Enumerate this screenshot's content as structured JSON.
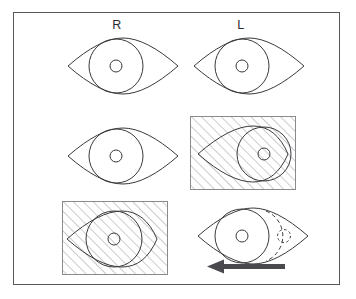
{
  "figure": {
    "kind": "clinical-illustration",
    "frame_color": "#58585c",
    "background_color": "#ffffff",
    "ink_color": "#3a3a3e",
    "hatch_color": "#9a9a9e",
    "arrow_color": "#4a4a4e"
  },
  "columns": [
    {
      "id": "right-eye-column",
      "label": "R"
    },
    {
      "id": "left-eye-column",
      "label": "L"
    }
  ],
  "panels": [
    {
      "id": "row1-right-eye",
      "row": 1,
      "column": "R",
      "occluded": false,
      "iris_position": "slightly-nasal",
      "pupil": "solid",
      "ghost_iris": false,
      "arrow": null
    },
    {
      "id": "row1-left-eye",
      "row": 1,
      "column": "L",
      "occluded": false,
      "iris_position": "slightly-nasal",
      "pupil": "solid",
      "ghost_iris": false,
      "arrow": null
    },
    {
      "id": "row2-right-eye",
      "row": 2,
      "column": "R",
      "occluded": false,
      "iris_position": "slightly-nasal",
      "pupil": "solid",
      "ghost_iris": false,
      "arrow": null
    },
    {
      "id": "row2-left-eye-covered",
      "row": 2,
      "column": "L",
      "occluded": true,
      "iris_position": "temporal-deviated",
      "pupil": "solid",
      "ghost_iris": false,
      "arrow": null
    },
    {
      "id": "row3-right-eye-covered",
      "row": 3,
      "column": "R",
      "occluded": true,
      "iris_position": "central",
      "pupil": "solid",
      "ghost_iris": false,
      "arrow": null
    },
    {
      "id": "row3-left-eye-refixating",
      "row": 3,
      "column": "L",
      "occluded": false,
      "iris_position": "nasal",
      "pupil": "solid",
      "ghost_iris": true,
      "arrow": "left"
    }
  ],
  "annotations": {
    "arrow_direction": "left",
    "arrow_meaning": "refixation movement"
  }
}
